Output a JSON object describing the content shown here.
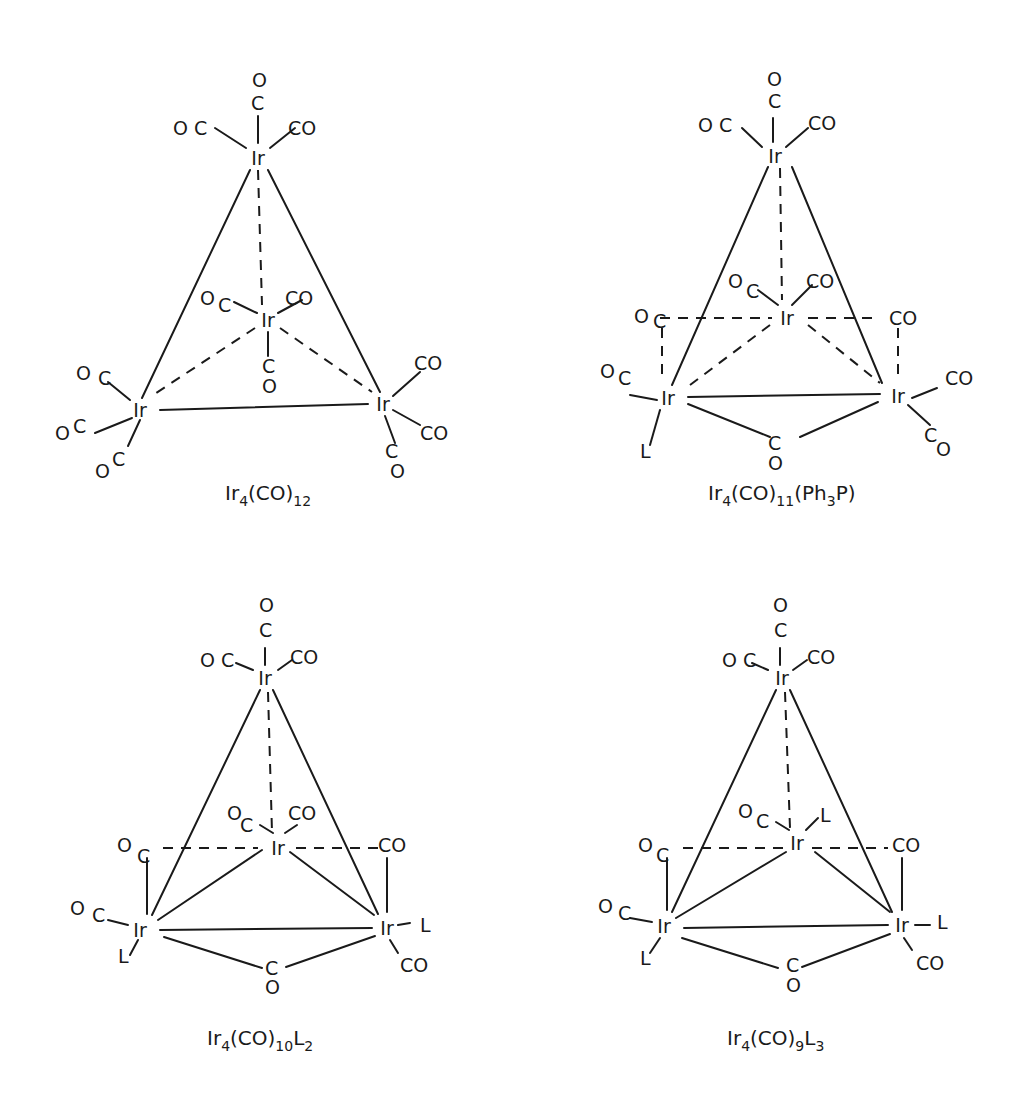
{
  "figure": {
    "background": "#ffffff",
    "ink_color": "#1a1a1a",
    "structures": [
      {
        "id": "ir4co12",
        "caption": {
          "base": "Ir",
          "n1": "4",
          "mid": "(CO)",
          "n2": "12",
          "tail": "",
          "n3": "",
          "x": 225,
          "y": 500
        },
        "metals": [
          {
            "label": "Ir",
            "x": 258,
            "y": 158
          },
          {
            "label": "Ir",
            "x": 268,
            "y": 320
          },
          {
            "label": "Ir",
            "x": 140,
            "y": 410
          },
          {
            "label": "Ir",
            "x": 383,
            "y": 404
          }
        ],
        "solid_bonds": [
          [
            250,
            170,
            142,
            398
          ],
          [
            268,
            170,
            380,
            392
          ],
          [
            160,
            410,
            368,
            404
          ]
        ],
        "dashed_bonds": [
          [
            258,
            170,
            262,
            305
          ],
          [
            255,
            328,
            150,
            397
          ],
          [
            280,
            328,
            372,
            392
          ]
        ],
        "ligand_bonds": [
          [
            258,
            143,
            258,
            116
          ],
          [
            246,
            148,
            215,
            128
          ],
          [
            270,
            148,
            295,
            128
          ],
          [
            257,
            313,
            234,
            302
          ],
          [
            278,
            313,
            302,
            300
          ],
          [
            268,
            332,
            268,
            356
          ],
          [
            130,
            400,
            108,
            382
          ],
          [
            132,
            418,
            95,
            433
          ],
          [
            140,
            420,
            128,
            446
          ],
          [
            393,
            396,
            420,
            372
          ],
          [
            393,
            410,
            420,
            425
          ],
          [
            385,
            416,
            395,
            443
          ]
        ],
        "labels": [
          {
            "text": "O",
            "x": 252,
            "y": 87
          },
          {
            "text": "C",
            "x": 251,
            "y": 110
          },
          {
            "text": "O C",
            "x": 173,
            "y": 135
          },
          {
            "text": "CO",
            "x": 288,
            "y": 135
          },
          {
            "text": "O",
            "x": 200,
            "y": 305
          },
          {
            "text": "C",
            "x": 218,
            "y": 312
          },
          {
            "text": "CO",
            "x": 285,
            "y": 305
          },
          {
            "text": "C",
            "x": 262,
            "y": 373
          },
          {
            "text": "O",
            "x": 262,
            "y": 393
          },
          {
            "text": "O",
            "x": 76,
            "y": 380
          },
          {
            "text": "C",
            "x": 98,
            "y": 385
          },
          {
            "text": "O",
            "x": 55,
            "y": 440
          },
          {
            "text": "C",
            "x": 73,
            "y": 433
          },
          {
            "text": "O",
            "x": 95,
            "y": 478
          },
          {
            "text": "C",
            "x": 112,
            "y": 466
          },
          {
            "text": "CO",
            "x": 414,
            "y": 370
          },
          {
            "text": "CO",
            "x": 420,
            "y": 440
          },
          {
            "text": "C",
            "x": 385,
            "y": 458
          },
          {
            "text": "O",
            "x": 390,
            "y": 478
          }
        ]
      },
      {
        "id": "ir4co11pph3",
        "caption": {
          "base": "Ir",
          "n1": "4",
          "mid": "(CO)",
          "n2": "11",
          "tail": "(Ph",
          "n3": "3",
          "tail2": "P)",
          "x": 708,
          "y": 500
        },
        "metals": [
          {
            "label": "Ir",
            "x": 775,
            "y": 156
          },
          {
            "label": "Ir",
            "x": 787,
            "y": 318
          },
          {
            "label": "Ir",
            "x": 668,
            "y": 398
          },
          {
            "label": "Ir",
            "x": 898,
            "y": 396
          }
        ],
        "solid_bonds": [
          [
            768,
            167,
            672,
            385
          ],
          [
            792,
            167,
            882,
            383
          ],
          [
            688,
            397,
            880,
            394
          ],
          [
            688,
            404,
            770,
            437
          ],
          [
            878,
            402,
            800,
            437
          ]
        ],
        "dashed_bonds": [
          [
            780,
            168,
            782,
            300
          ],
          [
            770,
            325,
            690,
            385
          ],
          [
            808,
            325,
            880,
            383
          ],
          [
            660,
            318,
            772,
            318
          ],
          [
            808,
            318,
            880,
            318
          ],
          [
            662,
            328,
            662,
            380
          ],
          [
            898,
            328,
            898,
            382
          ]
        ],
        "ligand_bonds": [
          [
            773,
            142,
            773,
            118
          ],
          [
            762,
            147,
            742,
            128
          ],
          [
            786,
            147,
            808,
            128
          ],
          [
            778,
            305,
            758,
            290
          ],
          [
            792,
            305,
            812,
            285
          ],
          [
            657,
            400,
            630,
            395
          ],
          [
            912,
            398,
            937,
            388
          ],
          [
            908,
            405,
            930,
            425
          ],
          [
            660,
            410,
            650,
            445
          ]
        ],
        "labels": [
          {
            "text": "O",
            "x": 767,
            "y": 86
          },
          {
            "text": "C",
            "x": 768,
            "y": 108
          },
          {
            "text": "O C",
            "x": 698,
            "y": 132
          },
          {
            "text": "CO",
            "x": 808,
            "y": 130
          },
          {
            "text": "O",
            "x": 728,
            "y": 288
          },
          {
            "text": "C",
            "x": 746,
            "y": 298
          },
          {
            "text": "CO",
            "x": 806,
            "y": 288
          },
          {
            "text": "O",
            "x": 634,
            "y": 323
          },
          {
            "text": "C",
            "x": 653,
            "y": 328
          },
          {
            "text": "CO",
            "x": 889,
            "y": 325
          },
          {
            "text": "O",
            "x": 600,
            "y": 378
          },
          {
            "text": "C",
            "x": 618,
            "y": 385
          },
          {
            "text": "CO",
            "x": 945,
            "y": 385
          },
          {
            "text": "L",
            "x": 640,
            "y": 458
          },
          {
            "text": "C",
            "x": 768,
            "y": 450
          },
          {
            "text": "O",
            "x": 768,
            "y": 470
          },
          {
            "text": "C",
            "x": 924,
            "y": 442
          },
          {
            "text": "O",
            "x": 936,
            "y": 456
          }
        ]
      },
      {
        "id": "ir4co10l2",
        "caption": {
          "base": "Ir",
          "n1": "4",
          "mid": "(CO)",
          "n2": "10",
          "tail": "L",
          "n3": "2",
          "x": 207,
          "y": 1045
        },
        "metals": [
          {
            "label": "Ir",
            "x": 265,
            "y": 678
          },
          {
            "label": "Ir",
            "x": 278,
            "y": 848
          },
          {
            "label": "Ir",
            "x": 140,
            "y": 930
          },
          {
            "label": "Ir",
            "x": 387,
            "y": 928
          }
        ],
        "solid_bonds": [
          [
            260,
            690,
            152,
            915
          ],
          [
            273,
            690,
            378,
            914
          ],
          [
            160,
            930,
            372,
            928
          ],
          [
            158,
            920,
            262,
            850
          ],
          [
            290,
            852,
            374,
            915
          ],
          [
            164,
            937,
            262,
            968
          ],
          [
            375,
            936,
            286,
            967
          ],
          [
            147,
            858,
            147,
            914
          ],
          [
            387,
            858,
            387,
            912
          ]
        ],
        "dashed_bonds": [
          [
            268,
            692,
            272,
            832
          ],
          [
            163,
            848,
            258,
            848
          ],
          [
            296,
            848,
            382,
            848
          ]
        ],
        "ligand_bonds": [
          [
            265,
            665,
            265,
            648
          ],
          [
            253,
            670,
            236,
            663
          ],
          [
            278,
            670,
            292,
            660
          ],
          [
            273,
            833,
            260,
            825
          ],
          [
            285,
            833,
            297,
            825
          ],
          [
            128,
            925,
            108,
            920
          ],
          [
            138,
            940,
            130,
            955
          ],
          [
            398,
            925,
            410,
            923
          ],
          [
            390,
            940,
            398,
            953
          ]
        ],
        "labels": [
          {
            "text": "O",
            "x": 259,
            "y": 612
          },
          {
            "text": "C",
            "x": 259,
            "y": 637
          },
          {
            "text": "O C",
            "x": 200,
            "y": 667
          },
          {
            "text": "CO",
            "x": 290,
            "y": 664
          },
          {
            "text": "O",
            "x": 227,
            "y": 820
          },
          {
            "text": "C",
            "x": 240,
            "y": 832
          },
          {
            "text": "CO",
            "x": 288,
            "y": 820
          },
          {
            "text": "O",
            "x": 117,
            "y": 852
          },
          {
            "text": "C",
            "x": 137,
            "y": 863
          },
          {
            "text": "CO",
            "x": 378,
            "y": 852
          },
          {
            "text": "O",
            "x": 70,
            "y": 915
          },
          {
            "text": "C",
            "x": 92,
            "y": 922
          },
          {
            "text": "L",
            "x": 118,
            "y": 963
          },
          {
            "text": "L",
            "x": 420,
            "y": 932
          },
          {
            "text": "CO",
            "x": 400,
            "y": 972
          },
          {
            "text": "C",
            "x": 265,
            "y": 975
          },
          {
            "text": "O",
            "x": 265,
            "y": 994
          }
        ]
      },
      {
        "id": "ir4co9l3",
        "caption": {
          "base": "Ir",
          "n1": "4",
          "mid": "(CO)",
          "n2": "9",
          "tail": "L",
          "n3": "3",
          "x": 727,
          "y": 1045
        },
        "metals": [
          {
            "label": "Ir",
            "x": 782,
            "y": 678
          },
          {
            "label": "Ir",
            "x": 797,
            "y": 843
          },
          {
            "label": "Ir",
            "x": 664,
            "y": 926
          },
          {
            "label": "Ir",
            "x": 902,
            "y": 925
          }
        ],
        "solid_bonds": [
          [
            776,
            690,
            672,
            912
          ],
          [
            790,
            690,
            892,
            912
          ],
          [
            684,
            928,
            888,
            925
          ],
          [
            676,
            918,
            786,
            852
          ],
          [
            815,
            852,
            890,
            912
          ],
          [
            682,
            938,
            778,
            968
          ],
          [
            890,
            934,
            802,
            967
          ],
          [
            667,
            858,
            667,
            910
          ],
          [
            902,
            858,
            902,
            910
          ]
        ],
        "dashed_bonds": [
          [
            785,
            692,
            790,
            828
          ],
          [
            683,
            848,
            784,
            848
          ],
          [
            812,
            848,
            888,
            848
          ]
        ],
        "ligand_bonds": [
          [
            780,
            665,
            780,
            648
          ],
          [
            768,
            670,
            752,
            663
          ],
          [
            793,
            670,
            807,
            660
          ],
          [
            789,
            830,
            776,
            822
          ],
          [
            806,
            830,
            818,
            818
          ],
          [
            652,
            922,
            630,
            918
          ],
          [
            660,
            938,
            650,
            953
          ],
          [
            915,
            925,
            930,
            925
          ],
          [
            904,
            938,
            912,
            950
          ]
        ],
        "labels": [
          {
            "text": "O",
            "x": 773,
            "y": 612
          },
          {
            "text": "C",
            "x": 774,
            "y": 637
          },
          {
            "text": "O C",
            "x": 722,
            "y": 667
          },
          {
            "text": "CO",
            "x": 807,
            "y": 664
          },
          {
            "text": "O",
            "x": 738,
            "y": 818
          },
          {
            "text": "C",
            "x": 756,
            "y": 828
          },
          {
            "text": "L",
            "x": 820,
            "y": 822
          },
          {
            "text": "O",
            "x": 638,
            "y": 852
          },
          {
            "text": "C",
            "x": 656,
            "y": 862
          },
          {
            "text": "CO",
            "x": 892,
            "y": 852
          },
          {
            "text": "O",
            "x": 598,
            "y": 913
          },
          {
            "text": "C",
            "x": 618,
            "y": 920
          },
          {
            "text": "L",
            "x": 640,
            "y": 965
          },
          {
            "text": "L",
            "x": 937,
            "y": 929
          },
          {
            "text": "CO",
            "x": 916,
            "y": 970
          },
          {
            "text": "C",
            "x": 786,
            "y": 972
          },
          {
            "text": "O",
            "x": 786,
            "y": 992
          }
        ]
      }
    ]
  }
}
